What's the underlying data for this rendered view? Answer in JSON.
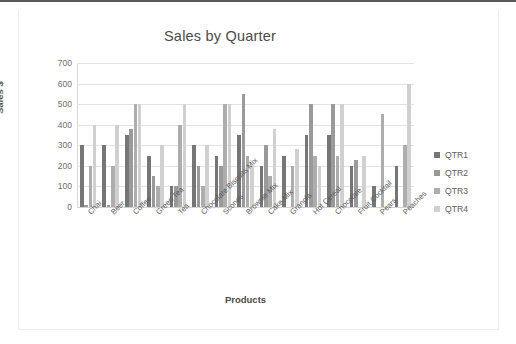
{
  "chart_data": {
    "type": "bar",
    "title": "Sales by Quarter",
    "xlabel": "Products",
    "ylabel": "Sales $",
    "ylim": [
      0,
      700
    ],
    "yticks": [
      700,
      600,
      500,
      400,
      300,
      200,
      100,
      0
    ],
    "grid": true,
    "legend_position": "right",
    "categories": [
      "Chai",
      "Beer",
      "Coffee",
      "Green Tea",
      "Tea",
      "Chocolate Biscuits Mix",
      "Scones",
      "Brownie Mix",
      "Cake Mix",
      "Granola",
      "Hot Cereal",
      "Chocolate",
      "Fruit Cocktail",
      "Pears",
      "Peaches"
    ],
    "series": [
      {
        "name": "QTR1",
        "color": "#767676",
        "values": [
          300,
          300,
          350,
          250,
          100,
          300,
          250,
          350,
          200,
          250,
          350,
          350,
          200,
          100,
          200
        ]
      },
      {
        "name": "QTR2",
        "color": "#9a9a9a",
        "values": [
          10,
          10,
          380,
          150,
          100,
          200,
          200,
          550,
          300,
          0,
          500,
          500,
          230,
          0,
          0
        ]
      },
      {
        "name": "QTR3",
        "color": "#adadad",
        "values": [
          200,
          200,
          500,
          100,
          400,
          100,
          500,
          250,
          150,
          200,
          250,
          250,
          0,
          450,
          300
        ]
      },
      {
        "name": "QTR4",
        "color": "#d0d0d0",
        "values": [
          400,
          400,
          500,
          300,
          500,
          300,
          500,
          200,
          380,
          280,
          200,
          500,
          250,
          0,
          600
        ]
      }
    ]
  }
}
